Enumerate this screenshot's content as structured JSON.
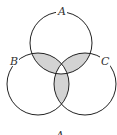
{
  "diagram": {
    "type": "venn",
    "sets": [
      {
        "id": "A",
        "label": "A",
        "cx": 61,
        "cy": 43,
        "r": 31
      },
      {
        "id": "B",
        "label": "B",
        "cx": 38,
        "cy": 84,
        "r": 31
      },
      {
        "id": "C",
        "label": "C",
        "cx": 85,
        "cy": 84,
        "r": 31
      }
    ],
    "shaded_regions": [
      "A∩B only",
      "A∩C only",
      "B∩C only"
    ],
    "unshaded_regions": [
      "A only",
      "B only",
      "C only",
      "A∩B∩C"
    ],
    "shade_color": "#d3d3d3",
    "stroke_color": "#222222",
    "bottom_label": "A"
  }
}
